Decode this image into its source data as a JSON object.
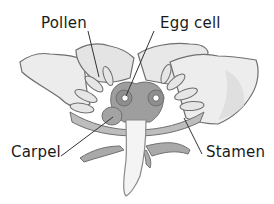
{
  "diagram": {
    "title": "",
    "labels": [
      {
        "id": "pollen",
        "text": "Pollen",
        "x": 41,
        "y": 16
      },
      {
        "id": "egg_cell",
        "text": "Egg cell",
        "x": 160,
        "y": 16
      },
      {
        "id": "carpel",
        "text": "Carpel",
        "x": 11,
        "y": 145
      },
      {
        "id": "stamen",
        "text": "Stamen",
        "x": 206,
        "y": 145
      }
    ],
    "leader_lines": [
      {
        "from": "pollen",
        "x1": 88,
        "y1": 31,
        "x2": 99,
        "y2": 77
      },
      {
        "from": "egg_cell",
        "x1": 154,
        "y1": 31,
        "x2": 126,
        "y2": 96
      },
      {
        "from": "carpel",
        "x1": 61,
        "y1": 156,
        "x2": 113,
        "y2": 117
      },
      {
        "from": "stamen",
        "x1": 202,
        "y1": 154,
        "x2": 184,
        "y2": 118
      }
    ],
    "colors": {
      "outline": "#6f6f6f",
      "petal_fill": "#ececec",
      "petal_shade": "#d6d6d6",
      "sepal_fill": "#a9a9a9",
      "ovary_fill": "#9a9a9a",
      "stem_fill": "#f2f2f2",
      "text": "#1a1a1a",
      "line": "#333333"
    }
  }
}
